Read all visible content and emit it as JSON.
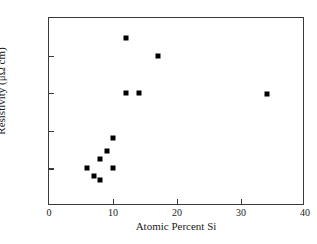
{
  "chart_data": {
    "type": "scatter",
    "title": "",
    "xlabel": "Atomic Percent Si",
    "ylabel": "Resistivity (μΩ cm)",
    "xlim": [
      0,
      40
    ],
    "ylim": [
      200,
      1200
    ],
    "xticks": [
      0,
      10,
      20,
      30,
      40
    ],
    "yticks": [
      200,
      400,
      600,
      800,
      1000,
      1200
    ],
    "xtick_labels": [
      "0",
      "10",
      "20",
      "30",
      "40"
    ],
    "ytick_labels": [
      "200",
      "400",
      "600",
      "800",
      "1000",
      "1200"
    ],
    "grid": false,
    "legend": null,
    "marker": "filled-square",
    "marker_color": "#000000",
    "series": [
      {
        "name": "Resistivity vs Atomic Percent Si",
        "points": [
          {
            "x": 6,
            "y": 400
          },
          {
            "x": 7,
            "y": 360
          },
          {
            "x": 8,
            "y": 340
          },
          {
            "x": 8,
            "y": 450
          },
          {
            "x": 9,
            "y": 495
          },
          {
            "x": 10,
            "y": 560
          },
          {
            "x": 10,
            "y": 400
          },
          {
            "x": 12,
            "y": 1095
          },
          {
            "x": 12,
            "y": 800
          },
          {
            "x": 14,
            "y": 800
          },
          {
            "x": 17,
            "y": 1000
          },
          {
            "x": 34,
            "y": 795
          }
        ]
      }
    ]
  },
  "figure": {
    "background_color": "#ffffff",
    "frame_color": "#3a3a3a",
    "text_color": "#1a1a1a"
  }
}
